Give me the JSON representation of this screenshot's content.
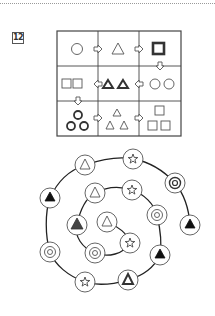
{
  "page": {
    "background": "#ffffff",
    "problem_number": "12"
  },
  "grid": {
    "rows": 3,
    "cols": 3,
    "cells": [
      [
        {
          "shapes": [
            "circle-outline"
          ]
        },
        {
          "shapes": [
            "triangle-outline"
          ]
        },
        {
          "shapes": [
            "square-bold"
          ]
        }
      ],
      [
        {
          "shapes": [
            "square-outline",
            "square-outline"
          ]
        },
        {
          "shapes": [
            "triangle-bold",
            "triangle-bold"
          ]
        },
        {
          "shapes": [
            "circle-outline",
            "circle-outline"
          ]
        }
      ],
      [
        {
          "shapes": [
            "circle-bold",
            "circle-bold",
            "circle-bold"
          ]
        },
        {
          "shapes": [
            "triangle-outline",
            "triangle-outline",
            "triangle-outline"
          ]
        },
        {
          "shapes": [
            "square-outline",
            "square-outline",
            "square-outline"
          ]
        }
      ]
    ],
    "arrows": [
      {
        "from": [
          0,
          0
        ],
        "to": [
          0,
          1
        ],
        "direction": "right"
      },
      {
        "from": [
          0,
          1
        ],
        "to": [
          0,
          2
        ],
        "direction": "right"
      },
      {
        "from": [
          0,
          2
        ],
        "to": [
          1,
          2
        ],
        "direction": "down"
      },
      {
        "from": [
          1,
          2
        ],
        "to": [
          1,
          1
        ],
        "direction": "left"
      },
      {
        "from": [
          1,
          1
        ],
        "to": [
          1,
          0
        ],
        "direction": "left"
      },
      {
        "from": [
          1,
          0
        ],
        "to": [
          2,
          0
        ],
        "direction": "down"
      },
      {
        "from": [
          2,
          0
        ],
        "to": [
          2,
          1
        ],
        "direction": "right"
      },
      {
        "from": [
          2,
          1
        ],
        "to": [
          2,
          2
        ],
        "direction": "right"
      }
    ]
  },
  "spiral": {
    "nodes_from_center": [
      "triangle-outline",
      "star",
      "target",
      "triangle-filled-dark",
      "triangle-outline",
      "star",
      "target",
      "triangle-filled",
      "triangle-bold-outline",
      "star",
      "target",
      "triangle-filled",
      "triangle-outline",
      "star",
      "target",
      "triangle-filled"
    ]
  }
}
